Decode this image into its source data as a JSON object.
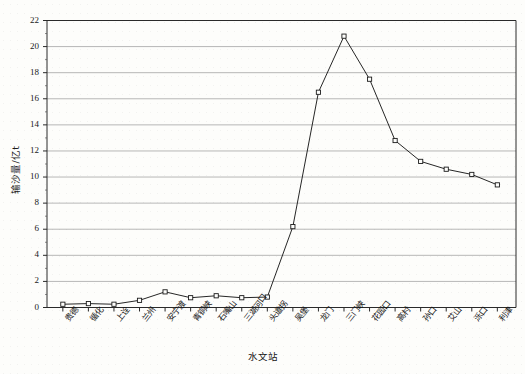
{
  "chart_data": {
    "type": "line",
    "title": "",
    "xlabel": "水文站",
    "ylabel": "输沙量/亿t",
    "ylim": [
      0,
      22
    ],
    "ytick_step": 2,
    "grid": "horizontal",
    "legend": "none",
    "marker": "open-square",
    "line_color": "#1a1a1a",
    "grid_color": "#9a9a9a",
    "categories": [
      "贵德",
      "循化",
      "上诠",
      "兰州",
      "安宁渡",
      "青铜峡",
      "石嘴山",
      "三湖河口",
      "头道拐",
      "吴堡",
      "龙门",
      "三门峡",
      "花园口",
      "高村",
      "孙口",
      "艾山",
      "泺口",
      "利津"
    ],
    "values": [
      0.25,
      0.3,
      0.25,
      0.55,
      1.2,
      0.75,
      0.9,
      0.75,
      0.8,
      6.2,
      16.5,
      20.8,
      17.5,
      12.8,
      11.2,
      10.6,
      10.2,
      9.4
    ],
    "yticks": [
      "0",
      "2",
      "4",
      "6",
      "8",
      "10",
      "12",
      "14",
      "16",
      "18",
      "20",
      "22"
    ]
  }
}
